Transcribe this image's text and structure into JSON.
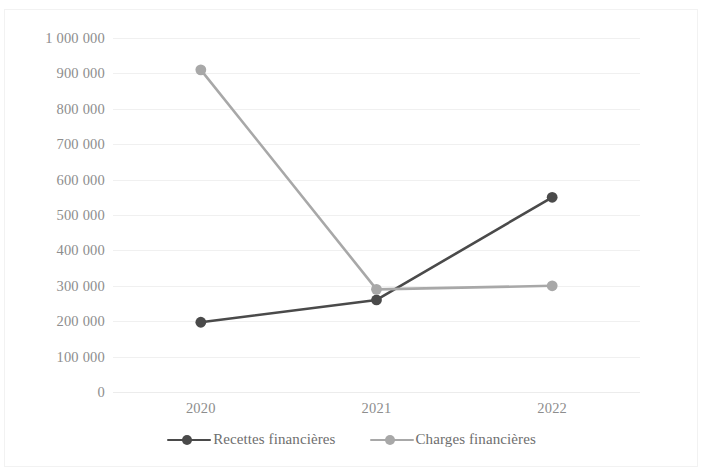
{
  "chart_data": {
    "type": "line",
    "title": "",
    "subtitle": "",
    "xlabel": "",
    "ylabel": "",
    "categories": [
      "2020",
      "2021",
      "2022"
    ],
    "ylim": [
      0,
      1000000
    ],
    "ytick_step": 100000,
    "ytick_labels": [
      "1 000 000",
      "900 000",
      "800 000",
      "700 000",
      "600 000",
      "500 000",
      "400 000",
      "300 000",
      "200 000",
      "100 000",
      "0"
    ],
    "ytick_values": [
      1000000,
      900000,
      800000,
      700000,
      600000,
      500000,
      400000,
      300000,
      200000,
      100000,
      0
    ],
    "grid": true,
    "grid_axis": "y",
    "legend_position": "bottom",
    "markers": "circle",
    "series": [
      {
        "name": "Recettes financières",
        "values": [
          197000,
          260000,
          550000
        ],
        "color": "#4a4a4a"
      },
      {
        "name": "Charges financières",
        "values": [
          910000,
          290000,
          300000
        ],
        "color": "#a8a8a8"
      }
    ]
  },
  "legend": {
    "items": [
      {
        "label": "Recettes financières",
        "color": "#4a4a4a"
      },
      {
        "label": "Charges financières",
        "color": "#a8a8a8"
      }
    ]
  },
  "axes": {
    "x_tick_labels": [
      "2020",
      "2021",
      "2022"
    ],
    "y_tick_labels": [
      "1 000 000",
      "900 000",
      "800 000",
      "700 000",
      "600 000",
      "500 000",
      "400 000",
      "300 000",
      "200 000",
      "100 000",
      "0"
    ]
  },
  "colors": {
    "series_recettes": "#4a4a4a",
    "series_charges": "#a8a8a8",
    "axis_text": "#8d8d8d",
    "gridline": "#f0f0f0",
    "frame": "#f2f2f2",
    "background": "#ffffff"
  }
}
